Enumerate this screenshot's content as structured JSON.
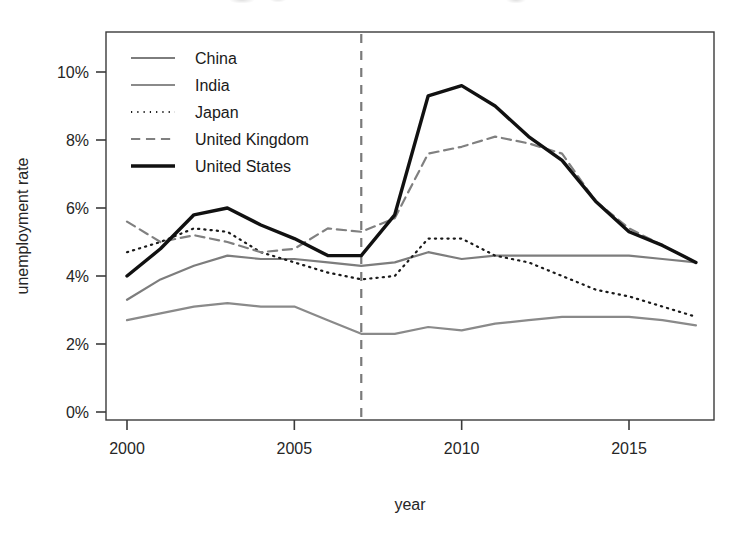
{
  "chart_data": {
    "type": "line",
    "title": "",
    "xlabel": "year",
    "ylabel": "unemployment rate",
    "xlim": [
      2000,
      2017
    ],
    "ylim": [
      0,
      11
    ],
    "grid": false,
    "legend_position": "top-left inside plot",
    "x_ticks": [
      2000,
      2005,
      2010,
      2015
    ],
    "x_tick_labels": [
      "2000",
      "2005",
      "2010",
      "2015"
    ],
    "y_ticks": [
      0,
      2,
      4,
      6,
      8,
      10
    ],
    "y_tick_labels": [
      "0%",
      "2%",
      "4%",
      "6%",
      "8%",
      "10%"
    ],
    "annotations": [
      {
        "name": "recession-marker",
        "type": "vertical-dashed-line",
        "x": 2007,
        "color": "#7a7a7a"
      }
    ],
    "x": [
      2000,
      2001,
      2002,
      2003,
      2004,
      2005,
      2006,
      2007,
      2008,
      2009,
      2010,
      2011,
      2012,
      2013,
      2014,
      2015,
      2016,
      2017
    ],
    "series": [
      {
        "name": "China",
        "style": "solid",
        "color": "#7d7d7d",
        "width": 2.2,
        "values": [
          3.3,
          3.9,
          4.3,
          4.6,
          4.5,
          4.5,
          4.4,
          4.3,
          4.4,
          4.7,
          4.5,
          4.6,
          4.6,
          4.6,
          4.6,
          4.6,
          4.5,
          4.4
        ]
      },
      {
        "name": "India",
        "style": "solid",
        "color": "#8a8a8a",
        "width": 2.2,
        "values": [
          2.7,
          2.9,
          3.1,
          3.2,
          3.1,
          3.1,
          2.7,
          2.3,
          2.3,
          2.5,
          2.4,
          2.6,
          2.7,
          2.8,
          2.8,
          2.8,
          2.7,
          2.55
        ]
      },
      {
        "name": "Japan",
        "style": "dotted",
        "color": "#1a1a1a",
        "width": 2.2,
        "values": [
          4.7,
          5.0,
          5.4,
          5.3,
          4.7,
          4.4,
          4.1,
          3.9,
          4.0,
          5.1,
          5.1,
          4.6,
          4.4,
          4.0,
          3.6,
          3.4,
          3.1,
          2.8
        ]
      },
      {
        "name": "United Kingdom",
        "style": "dashed",
        "color": "#808080",
        "width": 2.2,
        "values": [
          5.6,
          5.0,
          5.2,
          5.0,
          4.7,
          4.8,
          5.4,
          5.3,
          5.7,
          7.6,
          7.8,
          8.1,
          7.9,
          7.6,
          6.2,
          5.4,
          4.9,
          4.4
        ]
      },
      {
        "name": "United States",
        "style": "solid",
        "color": "#111111",
        "width": 3.4,
        "values": [
          4.0,
          4.8,
          5.8,
          6.0,
          5.5,
          5.1,
          4.6,
          4.6,
          5.8,
          9.3,
          9.6,
          9.0,
          8.1,
          7.4,
          6.2,
          5.3,
          4.9,
          4.4
        ]
      }
    ]
  },
  "legend": {
    "entries": [
      {
        "label": "China",
        "swatch": "solid-line-swatch"
      },
      {
        "label": "India",
        "swatch": "solid-line-swatch"
      },
      {
        "label": "Japan",
        "swatch": "dotted-line-swatch"
      },
      {
        "label": "United Kingdom",
        "swatch": "dashed-line-swatch"
      },
      {
        "label": "United States",
        "swatch": "thick-solid-line-swatch"
      }
    ]
  },
  "axes": {
    "x_title": "year",
    "y_title": "unemployment rate"
  }
}
